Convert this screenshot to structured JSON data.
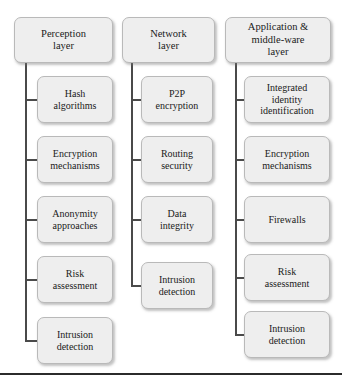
{
  "figure": {
    "type": "tree-diagram",
    "orientation": "three-column",
    "box_fill_color": "#eeeeee",
    "box_border_color": "#b9b9b9",
    "connector_color": "#4a4a4a",
    "rule_color": "#2b2b2b"
  },
  "columns": [
    {
      "id": "perception",
      "header": "Perception\nlayer",
      "children": [
        "Hash\nalgorithms",
        "Encryption\nmechanisms",
        "Anonymity\napproaches",
        "Risk\nassessment",
        "Intrusion\ndetection"
      ]
    },
    {
      "id": "network",
      "header": "Network\nlayer",
      "children": [
        "P2P\nencryption",
        "Routing\nsecurity",
        "Data\nintegrity",
        "Intrusion\ndetection"
      ]
    },
    {
      "id": "application",
      "header": "Application &\nmiddle-ware\nlayer",
      "children": [
        "Integrated\nidentity\nidentification",
        "Encryption\nmechanisms",
        "Firewalls",
        "Risk\nassessment",
        "Intrusion\ndetection"
      ]
    }
  ]
}
